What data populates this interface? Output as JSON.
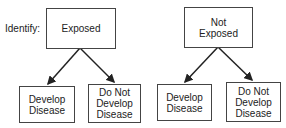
{
  "diagram": {
    "label": "Identify:",
    "groups": [
      {
        "parent": "Exposed",
        "children": [
          "Develop Disease",
          "Do Not Develop Disease"
        ]
      },
      {
        "parent": "Not Exposed",
        "children": [
          "Develop Disease",
          "Do Not Develop Disease"
        ]
      }
    ]
  }
}
